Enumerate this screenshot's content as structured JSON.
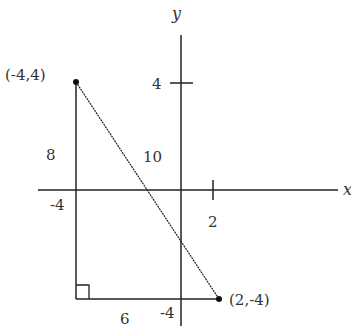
{
  "diagram": {
    "type": "right-triangle-on-coordinate-plane",
    "axes": {
      "x_label": "x",
      "y_label": "y",
      "ticks": {
        "y_tick_4": "4",
        "x_tick_2": "2",
        "y_tick_neg4": "-4",
        "x_tick_neg4": "-4"
      }
    },
    "points": {
      "p1": {
        "label": "(-4,4)",
        "x": -4,
        "y": 4
      },
      "p2": {
        "label": "(2,-4)",
        "x": 2,
        "y": -4
      }
    },
    "side_labels": {
      "vertical": "8",
      "horizontal": "6",
      "hypotenuse": "10"
    },
    "colors": {
      "stroke": "#222222",
      "text": "#333333",
      "background": "#ffffff"
    }
  }
}
